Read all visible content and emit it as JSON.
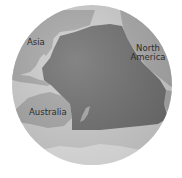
{
  "map": {
    "title": "Pacific Ocean globe",
    "labels": {
      "asia": "Asia",
      "north_america_line1": "North",
      "north_america_line2": "America",
      "australia": "Australia"
    },
    "colors": {
      "background": "#ffffff",
      "ocean_other": "#cfcfcf",
      "land": "#a9a9a9",
      "pacific_highlight": "#6f6f6f",
      "antarctica": "#e6e6e6",
      "label_text": "#2e2e2e"
    }
  }
}
